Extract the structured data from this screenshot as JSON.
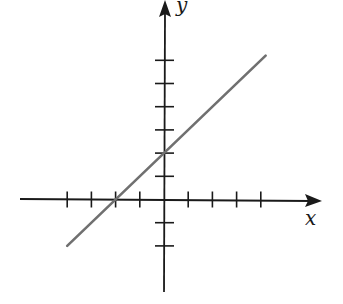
{
  "chart_data": {
    "type": "line",
    "title": "",
    "xlabel": "x",
    "ylabel": "y",
    "xlim": [
      -6,
      6.5
    ],
    "ylim": [
      -4,
      8.5
    ],
    "grid": false,
    "legend": null,
    "x_ticks": [
      -4,
      -3,
      -2,
      -1,
      1,
      2,
      3,
      4
    ],
    "y_ticks": [
      -2,
      -1,
      1,
      2,
      3,
      4,
      5,
      6
    ],
    "tick_labels_shown": false,
    "series": [
      {
        "name": "line",
        "equation": "y = x + 2",
        "x": [
          -4,
          4.2
        ],
        "y": [
          -2,
          6.2
        ],
        "color": "#707070"
      }
    ],
    "annotations": []
  },
  "axes": {
    "x_label": "x",
    "y_label": "y",
    "axis_color": "#1a1a1a",
    "line_color": "#707070"
  }
}
